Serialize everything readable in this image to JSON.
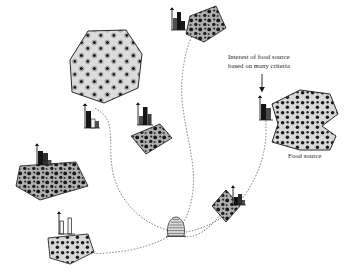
{
  "figure": {
    "type": "diagram",
    "background_color": "#ffffff",
    "width": 346,
    "height": 275
  },
  "annotations": {
    "interest_note": {
      "line1": "Interest of food source",
      "line2": "based on many criteria",
      "x": 228,
      "y": 52
    },
    "food_source_label": {
      "text": "Food source",
      "x": 288,
      "y": 152
    },
    "arrow": {
      "name": "annotation-arrow",
      "from": [
        262,
        74
      ],
      "to": [
        262,
        92
      ],
      "direction": "down"
    }
  },
  "hive": {
    "name": "bee-hive",
    "x": 168,
    "y": 219,
    "width": 20,
    "height": 18,
    "stripes": 6,
    "fill": "#d9d9d9",
    "stroke": "#2b2b2b"
  },
  "colors": {
    "ink": "#1a1a1a",
    "patch_light_fill": "#d8d8d8",
    "patch_dark_fill": "#9a9a9a",
    "bee_body": "#111111",
    "path_dots": "#6e6e6e",
    "bar_dark": "#141414",
    "bar_mid": "#4f4f4f",
    "bar_light": "#f2f2f2",
    "axis": "#1a1a1a"
  },
  "food_sources": [
    {
      "id": "fs-top-left-large",
      "name": "food-source-patch-large-hexagon",
      "shape": "hexagon",
      "fill": "light",
      "bee_count": 24,
      "bee_density": "high",
      "centroid": [
        97,
        72
      ],
      "histogram": {
        "name": "interest-histogram-large-hexagon",
        "x": 84,
        "y": 104,
        "axis_height": 24,
        "bars": [
          {
            "height": 17,
            "shade": "dark"
          },
          {
            "height": 9,
            "shade": "light"
          },
          {
            "height": 7,
            "shade": "mid"
          }
        ]
      }
    },
    {
      "id": "fs-top-middle",
      "name": "food-source-patch-top-quad",
      "shape": "quadrilateral",
      "fill": "dark",
      "bee_count": 9,
      "bee_density": "high",
      "centroid": [
        202,
        25
      ],
      "histogram": {
        "name": "interest-histogram-top-quad",
        "x": 171,
        "y": 8,
        "axis_height": 21,
        "bars": [
          {
            "height": 12,
            "shade": "mid"
          },
          {
            "height": 18,
            "shade": "dark"
          },
          {
            "height": 9,
            "shade": "dark"
          }
        ]
      }
    },
    {
      "id": "fs-centre-small",
      "name": "food-source-patch-centre-quad",
      "shape": "quadrilateral",
      "fill": "dark",
      "bee_count": 7,
      "bee_density": "medium",
      "centroid": [
        148,
        139
      ],
      "histogram": {
        "name": "interest-histogram-centre-quad",
        "x": 137,
        "y": 103,
        "axis_height": 22,
        "bars": [
          {
            "height": 9,
            "shade": "mid"
          },
          {
            "height": 18,
            "shade": "dark"
          },
          {
            "height": 11,
            "shade": "mid"
          }
        ]
      }
    },
    {
      "id": "fs-left-triangle",
      "name": "food-source-patch-left-triangle",
      "shape": "triangle-quad",
      "fill": "dark",
      "bee_count": 18,
      "bee_density": "high",
      "centroid": [
        48,
        180
      ],
      "histogram": {
        "name": "interest-histogram-left-triangle",
        "x": 36,
        "y": 144,
        "axis_height": 21,
        "bars": [
          {
            "height": 14,
            "shade": "dark"
          },
          {
            "height": 12,
            "shade": "mid"
          },
          {
            "height": 5,
            "shade": "mid"
          }
        ]
      }
    },
    {
      "id": "fs-bottom-left",
      "name": "food-source-patch-bottom-quad",
      "shape": "quadrilateral",
      "fill": "light",
      "bee_count": 8,
      "bee_density": "medium",
      "centroid": [
        70,
        247
      ],
      "histogram": {
        "name": "interest-histogram-bottom-quad",
        "x": 58,
        "y": 212,
        "axis_height": 22,
        "bars": [
          {
            "height": 13,
            "shade": "outline"
          },
          {
            "height": 16,
            "shade": "outline"
          }
        ]
      }
    },
    {
      "id": "fs-right-diamond",
      "name": "food-source-patch-right-diamond",
      "shape": "diamond",
      "fill": "dark",
      "bee_count": 5,
      "bee_density": "medium",
      "centroid": [
        226,
        205
      ],
      "histogram": {
        "name": "interest-histogram-right-diamond",
        "x": 232,
        "y": 186,
        "axis_height": 19,
        "bars": [
          {
            "height": 8,
            "shade": "dark"
          },
          {
            "height": 11,
            "shade": "mid"
          },
          {
            "height": 5,
            "shade": "mid"
          }
        ]
      }
    },
    {
      "id": "fs-right-large",
      "name": "food-source-patch-right-arrow-polygon",
      "shape": "arrow-polygon",
      "fill": "light",
      "bee_count": 34,
      "bee_density": "very-high",
      "centroid": [
        295,
        122
      ],
      "histogram": {
        "name": "interest-histogram-right-polygon",
        "x": 259,
        "y": 96,
        "axis_height": 24,
        "bars": [
          {
            "height": 16,
            "shade": "dark"
          },
          {
            "height": 12,
            "shade": "mid"
          }
        ]
      }
    }
  ],
  "flight_paths": [
    {
      "name": "flight-path-to-large-hexagon",
      "from": "hive",
      "to": "fs-top-left-large",
      "style": "dotted"
    },
    {
      "name": "flight-path-to-top-quad",
      "from": "hive",
      "to": "fs-top-middle",
      "style": "dotted"
    },
    {
      "name": "flight-path-to-right-polygon",
      "from": "hive",
      "to": "fs-right-large",
      "style": "dotted"
    },
    {
      "name": "flight-path-to-right-diamond",
      "from": "hive",
      "to": "fs-right-diamond",
      "style": "dotted"
    },
    {
      "name": "flight-path-to-bottom-quad",
      "from": "hive",
      "to": "fs-bottom-left",
      "style": "dotted"
    }
  ]
}
